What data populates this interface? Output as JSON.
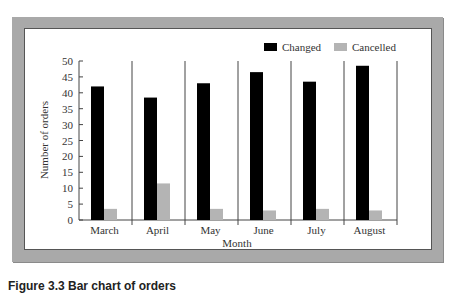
{
  "chart_data": {
    "type": "bar",
    "title": "",
    "xlabel": "Month",
    "ylabel": "Number of orders",
    "categories": [
      "March",
      "April",
      "May",
      "June",
      "July",
      "August"
    ],
    "series": [
      {
        "name": "Changed",
        "color": "#000000",
        "values": [
          42,
          38.5,
          43,
          46.5,
          43.5,
          48.5
        ]
      },
      {
        "name": "Cancelled",
        "color": "#b4b4b4",
        "values": [
          3.5,
          11.5,
          3.5,
          3,
          3.5,
          3
        ]
      }
    ],
    "ylim": [
      0,
      50
    ],
    "yticks": [
      0,
      5,
      10,
      15,
      20,
      25,
      30,
      35,
      40,
      45,
      50
    ],
    "grid": false,
    "legend_position": "top-right",
    "group_dividers": true
  },
  "legend": {
    "changed_label": "Changed",
    "cancelled_label": "Cancelled"
  },
  "caption": {
    "text": "Figure 3.3  Bar chart of orders"
  }
}
